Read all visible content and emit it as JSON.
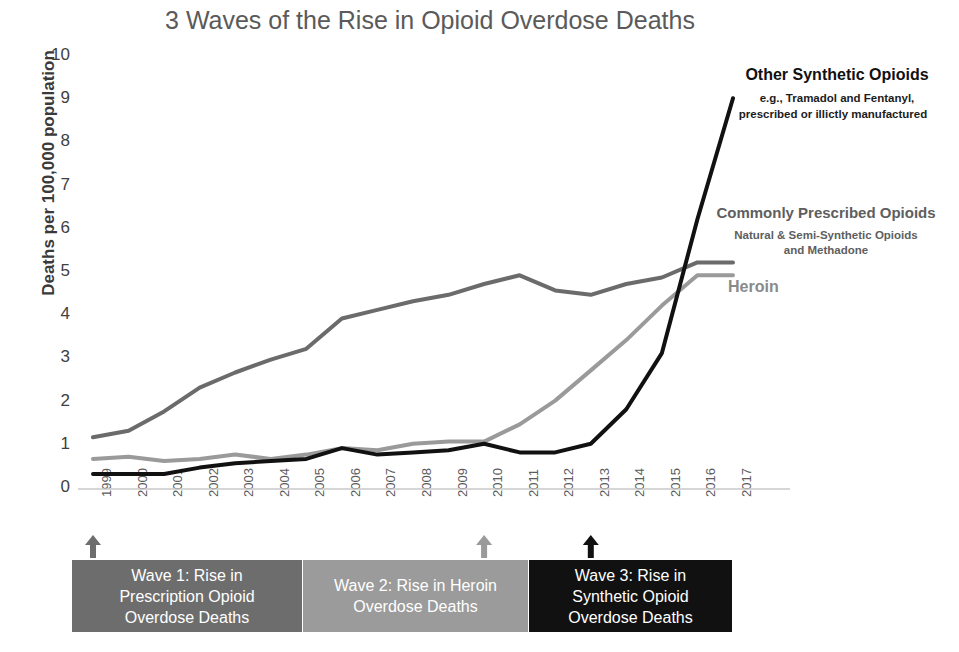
{
  "chart_data": {
    "type": "line",
    "title": "3 Waves of the Rise in Opioid Overdose Deaths",
    "xlabel": "",
    "ylabel": "Deaths per 100,000 population",
    "ylim": [
      0,
      10
    ],
    "yticks": [
      0,
      1,
      2,
      3,
      4,
      5,
      6,
      7,
      8,
      9,
      10
    ],
    "grid": false,
    "legend_position": "inline-right-annotations",
    "x": [
      "1999",
      "2000",
      "2001",
      "2002",
      "2003",
      "2004",
      "2005",
      "2006",
      "2007",
      "2008",
      "2009",
      "2010",
      "2011",
      "2012",
      "2013",
      "2014",
      "2015",
      "2016",
      "2017"
    ],
    "series": [
      {
        "name": "Commonly Prescribed Opioids",
        "sublabel": "Natural & Semi-Synthetic Opioids and Methadone",
        "color": "#6b6b6b",
        "values": [
          1.15,
          1.3,
          1.75,
          2.3,
          2.65,
          2.95,
          3.2,
          3.9,
          4.1,
          4.3,
          4.45,
          4.7,
          4.9,
          4.55,
          4.45,
          4.7,
          4.85,
          5.2,
          5.2
        ]
      },
      {
        "name": "Heroin",
        "sublabel": "",
        "color": "#9a9a9a",
        "values": [
          0.65,
          0.7,
          0.6,
          0.65,
          0.75,
          0.65,
          0.75,
          0.9,
          0.85,
          1.0,
          1.05,
          1.05,
          1.45,
          2.0,
          2.7,
          3.4,
          4.2,
          4.9,
          4.9
        ]
      },
      {
        "name": "Other Synthetic Opioids",
        "sublabel": "e.g., Tramadol and Fentanyl, prescribed or illictly manufactured",
        "color": "#111111",
        "values": [
          0.3,
          0.3,
          0.3,
          0.45,
          0.55,
          0.6,
          0.65,
          0.9,
          0.75,
          0.8,
          0.85,
          1.0,
          0.8,
          0.8,
          1.0,
          1.8,
          3.1,
          6.2,
          9.0
        ]
      }
    ],
    "annotations": [
      {
        "id": "wave1",
        "label": "Wave 1: Rise in Prescription Opioid Overdose Deaths",
        "marker_year": "1999",
        "color": "#6d6d6d"
      },
      {
        "id": "wave2",
        "label": "Wave 2: Rise in Heroin Overdose Deaths",
        "marker_year": "2010",
        "color": "#9a9a9a"
      },
      {
        "id": "wave3",
        "label": "Wave 3: Rise in Synthetic Opioid Overdose Deaths",
        "marker_year": "2013",
        "color": "#111111"
      }
    ]
  },
  "title": "3 Waves of the Rise in Opioid Overdose Deaths",
  "axes": {
    "y_title": "Deaths per 100,000 population",
    "y_ticks": [
      "10",
      "9",
      "8",
      "7",
      "6",
      "5",
      "4",
      "3",
      "2",
      "1",
      "0"
    ],
    "x_ticks": [
      "1999",
      "2000",
      "2001",
      "2002",
      "2003",
      "2004",
      "2005",
      "2006",
      "2007",
      "2008",
      "2009",
      "2010",
      "2011",
      "2012",
      "2013",
      "2014",
      "2015",
      "2016",
      "2017"
    ]
  },
  "annotations": {
    "synthetic": {
      "title": "Other Synthetic Opioids",
      "line1": "e.g., Tramadol and Fentanyl,",
      "line2": "prescribed or illictly manufactured"
    },
    "prescribed": {
      "title": "Commonly Prescribed Opioids",
      "line1": "Natural & Semi-Synthetic Opioids",
      "line2": "and Methadone"
    },
    "heroin": {
      "title": "Heroin"
    }
  },
  "waves": {
    "wave1": {
      "line1": "Wave 1: Rise in",
      "line2": "Prescription Opioid",
      "line3": "Overdose Deaths",
      "text": "Wave 1: Rise in Prescription Opioid Overdose Deaths",
      "color": "#6d6d6d"
    },
    "wave2": {
      "line1": "Wave 2: Rise in Heroin",
      "line2": "Overdose Deaths",
      "text": "Wave 2: Rise in Heroin Overdose Deaths",
      "color": "#9b9b9b"
    },
    "wave3": {
      "line1": "Wave 3: Rise in",
      "line2": "Synthetic Opioid",
      "line3": "Overdose Deaths",
      "text": "Wave 3: Rise in Synthetic Opioid Overdose Deaths",
      "color": "#111111"
    }
  }
}
